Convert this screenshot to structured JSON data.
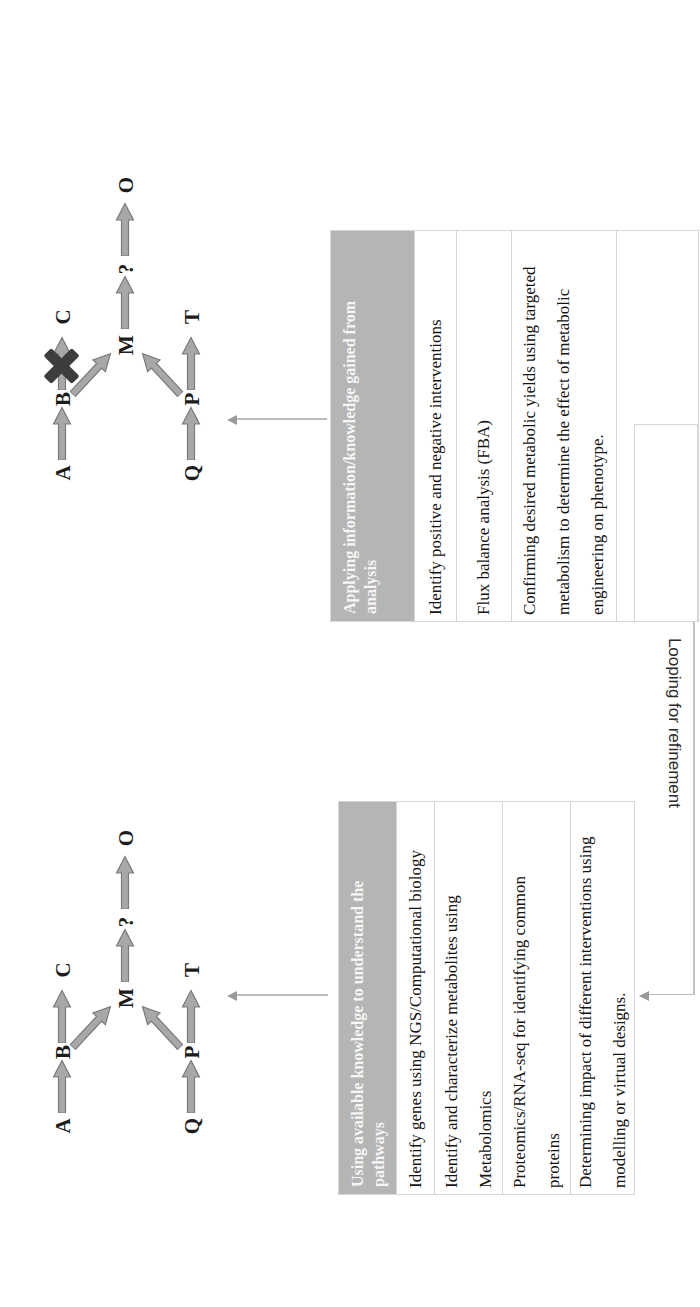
{
  "figure": {
    "stages": [
      {
        "id": "understanding",
        "pathway": {
          "nodes": [
            "A",
            "B",
            "C",
            "M",
            "?",
            "O",
            "Q",
            "P",
            "T"
          ],
          "knockout": false
        },
        "table": {
          "header": "Using available knowledge to understand the\npathways",
          "rows": [
            "Identify genes using NGS/Computational biology",
            "Identify and characterize metabolites using\nMetabolomics",
            "Proteomics/RNA-seq for identifying common\nproteins",
            "Determining impact of different interventions using\nmodelling or virtual designs."
          ]
        }
      },
      {
        "id": "applying",
        "pathway": {
          "nodes": [
            "A",
            "B",
            "C",
            "M",
            "?",
            "O",
            "Q",
            "P",
            "T"
          ],
          "knockout": true
        },
        "table": {
          "header": "Applying information/knowledge gained from\nanalysis",
          "rows": [
            "Identify positive and negative interventions",
            "Flux balance analysis (FBA)",
            "Confirming desired metabolic yields using targeted\nmetabolism to determine the effect of metabolic\nengineering on phenotype."
          ]
        }
      }
    ],
    "loop_label": "Looping for refinement",
    "colors": {
      "header_bg": "#b5b5b5",
      "arrow_fill": "#a8a8a8",
      "arrow_stroke": "#7a7a7a",
      "knockout": "#3d3d3d",
      "connector": "#bdbdbd"
    }
  }
}
